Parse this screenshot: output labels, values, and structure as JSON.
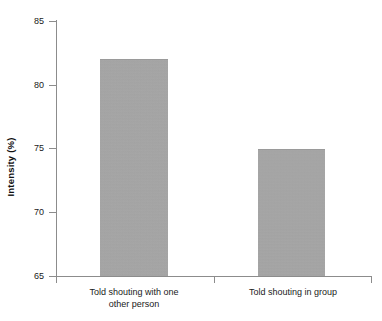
{
  "chart_data": {
    "type": "bar",
    "title": "",
    "subtitle": "",
    "xlabel": "",
    "ylabel": "Intensity (%)",
    "categories": [
      "Told shouting with one other person",
      "Told shouting in group"
    ],
    "category_lines": [
      [
        "Told shouting with one",
        "other person"
      ],
      [
        "Told shouting in group"
      ]
    ],
    "values": [
      82,
      75
    ],
    "ylim": [
      65,
      85
    ],
    "yticks": [
      65,
      70,
      75,
      80,
      85
    ],
    "ytick_labels": [
      "65",
      "70",
      "75",
      "80",
      "85"
    ],
    "grid": false,
    "legend": false,
    "legend_position": "none",
    "bar_color": "#a8a8a8",
    "axis_color": "#8c8c8c",
    "background_color": "#ffffff"
  }
}
